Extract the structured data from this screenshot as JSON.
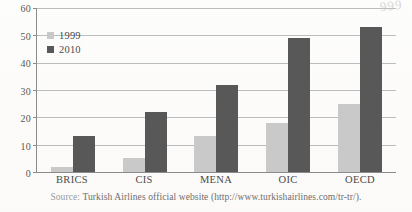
{
  "scan_artifact": "999",
  "legend": {
    "position": "top-left-inside",
    "entries": [
      {
        "label": "1999",
        "color": "#c9c9c9"
      },
      {
        "label": "2010",
        "color": "#585858"
      }
    ]
  },
  "source": {
    "prefix": "Source:",
    "text": "Turkish Airlines official website (http://www.turkishairlines.com/tr-tr/)."
  },
  "chart_data": {
    "type": "bar",
    "title": "",
    "subtitle": "",
    "xlabel": "",
    "ylabel": "",
    "ylim": [
      0,
      60
    ],
    "yticks": [
      0,
      10,
      20,
      30,
      40,
      50,
      60
    ],
    "ytick_labels": [
      "0",
      "10",
      "20",
      "30",
      "40",
      "50",
      "60"
    ],
    "grid": true,
    "grid_axis": "y",
    "legend_position": "upper left",
    "categories": [
      "BRICS",
      "CIS",
      "MENA",
      "OIC",
      "OECD"
    ],
    "series": [
      {
        "name": "1999",
        "color": "#c9c9c9",
        "values": [
          2,
          5,
          13,
          18,
          25
        ]
      },
      {
        "name": "2010",
        "color": "#585858",
        "values": [
          13,
          22,
          32,
          49,
          53
        ]
      }
    ],
    "annotations": []
  }
}
